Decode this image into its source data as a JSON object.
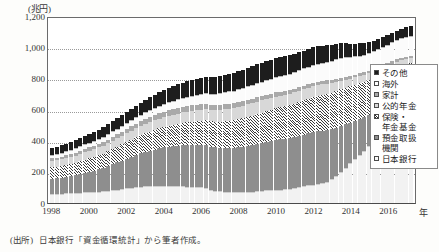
{
  "axes": {
    "y_unit_label": "(兆円)",
    "x_unit_label": "年",
    "y_ticks": [
      "0",
      "200",
      "400",
      "600",
      "800",
      "1,000",
      "1,200"
    ],
    "x_ticks": [
      "1998",
      "2000",
      "2002",
      "2004",
      "2006",
      "2008",
      "2010",
      "2012",
      "2014",
      "2016"
    ]
  },
  "legend": {
    "items": [
      {
        "label": "その他",
        "key": "oth"
      },
      {
        "label": "海外",
        "key": "for"
      },
      {
        "label": "家計",
        "key": "hh"
      },
      {
        "label": "公的年金",
        "key": "pub"
      },
      {
        "label": "保険・\n年金基金",
        "key": "ins"
      },
      {
        "label": "預金取扱\n機関",
        "key": "dep"
      },
      {
        "label": "日本銀行",
        "key": "boj"
      }
    ]
  },
  "source": {
    "tag": "(出所)",
    "text": "日本銀行「資金循環統計」から筆者作成。"
  },
  "chart_data": {
    "type": "bar",
    "title": "",
    "subtitle": "",
    "xlabel": "年",
    "ylabel": "兆円",
    "ylim": [
      0,
      1200
    ],
    "ytick_step": 200,
    "grid": true,
    "stacked": true,
    "legend_position": "right",
    "annotations": [],
    "note": "国債等保有者別残高（四半期、兆円）。積み上げ棒グラフ。",
    "x": [
      "1998Q1",
      "1998Q2",
      "1998Q3",
      "1998Q4",
      "1999Q1",
      "1999Q2",
      "1999Q3",
      "1999Q4",
      "2000Q1",
      "2000Q2",
      "2000Q3",
      "2000Q4",
      "2001Q1",
      "2001Q2",
      "2001Q3",
      "2001Q4",
      "2002Q1",
      "2002Q2",
      "2002Q3",
      "2002Q4",
      "2003Q1",
      "2003Q2",
      "2003Q3",
      "2003Q4",
      "2004Q1",
      "2004Q2",
      "2004Q3",
      "2004Q4",
      "2005Q1",
      "2005Q2",
      "2005Q3",
      "2005Q4",
      "2006Q1",
      "2006Q2",
      "2006Q3",
      "2006Q4",
      "2007Q1",
      "2007Q2",
      "2007Q3",
      "2007Q4",
      "2008Q1",
      "2008Q2",
      "2008Q3",
      "2008Q4",
      "2009Q1",
      "2009Q2",
      "2009Q3",
      "2009Q4",
      "2010Q1",
      "2010Q2",
      "2010Q3",
      "2010Q4",
      "2011Q1",
      "2011Q2",
      "2011Q3",
      "2011Q4",
      "2012Q1",
      "2012Q2",
      "2012Q3",
      "2012Q4",
      "2013Q1",
      "2013Q2",
      "2013Q3",
      "2013Q4",
      "2014Q1",
      "2014Q2",
      "2014Q3",
      "2014Q4",
      "2015Q1",
      "2015Q2",
      "2015Q3",
      "2015Q4",
      "2016Q1",
      "2016Q2",
      "2016Q3",
      "2016Q4",
      "2017Q1",
      "2017Q2"
    ],
    "series": [
      {
        "name": "日本銀行",
        "key": "boj",
        "values": [
          52,
          53,
          54,
          56,
          57,
          58,
          60,
          62,
          63,
          64,
          66,
          68,
          72,
          76,
          80,
          84,
          88,
          92,
          96,
          99,
          101,
          102,
          103,
          104,
          104,
          103,
          102,
          101,
          100,
          99,
          98,
          96,
          94,
          92,
          80,
          72,
          68,
          66,
          64,
          63,
          63,
          64,
          65,
          67,
          70,
          72,
          74,
          76,
          78,
          80,
          82,
          84,
          88,
          94,
          100,
          106,
          112,
          118,
          124,
          130,
          145,
          170,
          195,
          220,
          248,
          275,
          302,
          330,
          358,
          386,
          414,
          442,
          468,
          492,
          514,
          534,
          548,
          560
        ]
      },
      {
        "name": "預金取扱機関",
        "key": "dep",
        "values": [
          98,
          100,
          103,
          106,
          110,
          115,
          120,
          126,
          132,
          138,
          144,
          150,
          158,
          166,
          174,
          182,
          190,
          198,
          206,
          214,
          222,
          228,
          234,
          240,
          246,
          252,
          256,
          260,
          264,
          266,
          268,
          270,
          272,
          274,
          276,
          278,
          280,
          282,
          284,
          286,
          288,
          292,
          296,
          300,
          304,
          308,
          312,
          316,
          320,
          322,
          324,
          326,
          328,
          330,
          332,
          334,
          336,
          336,
          334,
          332,
          322,
          308,
          294,
          280,
          262,
          246,
          230,
          214,
          200,
          186,
          174,
          162,
          152,
          144,
          138,
          132,
          128,
          124
        ]
      },
      {
        "name": "保険・年金基金",
        "key": "ins",
        "values": [
          72,
          73,
          74,
          76,
          78,
          80,
          82,
          84,
          86,
          88,
          90,
          92,
          95,
          98,
          101,
          104,
          107,
          110,
          113,
          116,
          119,
          122,
          125,
          128,
          131,
          134,
          137,
          140,
          143,
          146,
          149,
          152,
          155,
          158,
          161,
          164,
          167,
          170,
          173,
          176,
          179,
          182,
          185,
          188,
          191,
          194,
          197,
          200,
          203,
          206,
          209,
          212,
          215,
          218,
          221,
          224,
          227,
          229,
          231,
          233,
          234,
          234,
          234,
          233,
          232,
          231,
          230,
          228,
          226,
          224,
          222,
          220,
          218,
          216,
          214,
          212,
          210,
          208
        ]
      },
      {
        "name": "公的年金",
        "key": "pub",
        "values": [
          40,
          41,
          42,
          43,
          44,
          45,
          46,
          47,
          48,
          49,
          50,
          51,
          52,
          53,
          54,
          55,
          56,
          57,
          58,
          59,
          60,
          61,
          62,
          63,
          64,
          65,
          66,
          67,
          68,
          69,
          70,
          71,
          72,
          73,
          74,
          75,
          76,
          77,
          78,
          79,
          80,
          80,
          80,
          80,
          80,
          79,
          78,
          77,
          76,
          75,
          74,
          73,
          72,
          71,
          70,
          69,
          68,
          67,
          66,
          65,
          62,
          59,
          56,
          53,
          50,
          48,
          46,
          44,
          42,
          40,
          39,
          38,
          37,
          36,
          35,
          34,
          33,
          32
        ]
      },
      {
        "name": "家計",
        "key": "hh",
        "values": [
          18,
          18,
          19,
          19,
          20,
          20,
          21,
          21,
          22,
          22,
          23,
          23,
          24,
          25,
          26,
          27,
          28,
          29,
          30,
          31,
          32,
          33,
          34,
          34,
          35,
          35,
          36,
          36,
          36,
          36,
          36,
          35,
          35,
          34,
          34,
          33,
          33,
          32,
          32,
          31,
          31,
          30,
          30,
          29,
          29,
          28,
          28,
          27,
          27,
          26,
          26,
          25,
          25,
          24,
          24,
          23,
          23,
          22,
          22,
          21,
          21,
          20,
          20,
          19,
          19,
          18,
          18,
          17,
          17,
          16,
          16,
          15,
          15,
          14,
          14,
          13,
          13,
          13
        ]
      },
      {
        "name": "海外",
        "key": "for",
        "values": [
          18,
          18,
          19,
          19,
          20,
          21,
          22,
          23,
          24,
          25,
          26,
          27,
          28,
          29,
          30,
          31,
          32,
          33,
          34,
          35,
          36,
          38,
          40,
          42,
          44,
          46,
          48,
          50,
          52,
          54,
          56,
          58,
          60,
          62,
          64,
          66,
          68,
          70,
          72,
          74,
          76,
          78,
          80,
          82,
          84,
          86,
          88,
          90,
          92,
          94,
          96,
          98,
          100,
          102,
          104,
          106,
          108,
          110,
          112,
          114,
          116,
          118,
          120,
          122,
          114,
          110,
          108,
          106,
          106,
          108,
          110,
          112,
          114,
          116,
          118,
          120,
          122,
          124
        ]
      },
      {
        "name": "その他",
        "key": "oth",
        "values": [
          44,
          45,
          46,
          47,
          48,
          50,
          52,
          54,
          56,
          58,
          60,
          62,
          64,
          66,
          68,
          70,
          72,
          74,
          76,
          78,
          80,
          82,
          84,
          86,
          88,
          90,
          92,
          94,
          96,
          98,
          100,
          102,
          104,
          106,
          108,
          110,
          112,
          113,
          114,
          115,
          116,
          117,
          118,
          119,
          120,
          120,
          120,
          120,
          120,
          119,
          118,
          117,
          116,
          115,
          114,
          113,
          112,
          110,
          108,
          106,
          102,
          98,
          94,
          90,
          86,
          82,
          78,
          74,
          72,
          70,
          68,
          66,
          64,
          62,
          61,
          60,
          60,
          60
        ]
      }
    ]
  }
}
